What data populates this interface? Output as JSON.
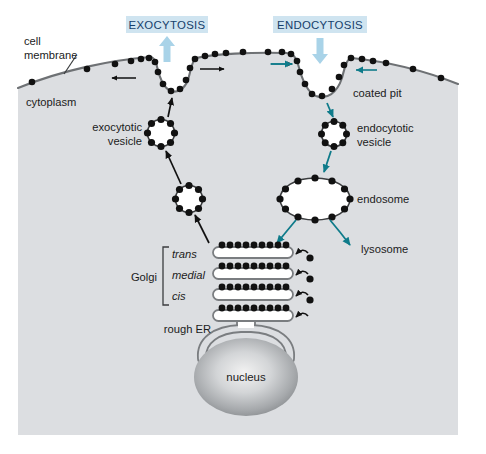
{
  "figure": {
    "width": 486,
    "height": 454
  },
  "colors": {
    "background": "#ffffff",
    "cytoplasm": "#dcdee1",
    "membrane_line": "#6e7174",
    "coat_dot": "#111111",
    "banner_fill": "#cfe4f0",
    "banner_text": "#15406b",
    "banner_arrow": "#a9d3e8",
    "teal_arrow": "#0f7b8a",
    "black_arrow": "#111111",
    "organelle_fill": "#ffffff",
    "organelle_stroke": "#7a7d80",
    "nucleus_light": "#e8e8e8",
    "nucleus_dark": "#8d9093"
  },
  "banners": [
    {
      "id": "exocytosis",
      "label": "EXOCYTOSIS",
      "x": 126,
      "y": 16,
      "w": 82,
      "h": 17,
      "arrow_direction": "up"
    },
    {
      "id": "endocytosis",
      "label": "ENDOCYTOSIS",
      "x": 273,
      "y": 16,
      "w": 94,
      "h": 17,
      "arrow_direction": "down"
    }
  ],
  "labels": [
    {
      "id": "cell-membrane",
      "text_line1": "cell",
      "text_line2": "membrane",
      "x": 24,
      "y": 43,
      "leader": true
    },
    {
      "id": "cytoplasm",
      "text_line1": "cytoplasm",
      "text_line2": "",
      "x": 26,
      "y": 104,
      "leader": false
    },
    {
      "id": "coated-pit",
      "text_line1": "coated pit",
      "text_line2": "",
      "x": 353,
      "y": 94,
      "leader": false
    },
    {
      "id": "exocytotic-vesicle",
      "text_line1": "exocytotic",
      "text_line2": "vesicle",
      "x": 85,
      "y": 132,
      "leader": false
    },
    {
      "id": "endocytotic-vesicle",
      "text_line1": "endocytotic",
      "text_line2": "vesicle",
      "x": 376,
      "y": 133,
      "leader": false
    },
    {
      "id": "endosome",
      "text_line1": "endosome",
      "text_line2": "",
      "x": 355,
      "y": 203,
      "leader": false
    },
    {
      "id": "lysosome",
      "text_line1": "lysosome",
      "text_line2": "",
      "x": 361,
      "y": 252,
      "leader": false
    },
    {
      "id": "golgi",
      "text_line1": "Golgi",
      "text_line2": "",
      "x": 130,
      "y": 277,
      "leader": false
    },
    {
      "id": "rough-er",
      "text_line1": "rough ER",
      "text_line2": "",
      "x": 159,
      "y": 330,
      "leader": false
    },
    {
      "id": "nucleus",
      "text_line1": "nucleus",
      "text_line2": "",
      "x": 246,
      "y": 377,
      "leader": false
    }
  ],
  "golgi_cisternae": [
    {
      "id": "trans",
      "label": "trans",
      "label_x": 171,
      "label_y": 258,
      "y": 252,
      "x": 213,
      "w": 78,
      "dots": 11
    },
    {
      "id": "medial",
      "label": "medial",
      "label_x": 171,
      "label_y": 277,
      "y": 271,
      "x": 213,
      "w": 78,
      "dots": 11
    },
    {
      "id": "cis",
      "label": "cis",
      "label_x": 171,
      "label_y": 296,
      "y": 290,
      "x": 213,
      "w": 78,
      "dots": 11
    },
    {
      "id": "rough-er-cisterna",
      "label": "",
      "label_x": 0,
      "label_y": 0,
      "y": 309,
      "x": 213,
      "w": 78,
      "dots": 11
    }
  ],
  "organelles": [
    {
      "id": "exocytotic-vesicle-upper",
      "shape": "coated-vesicle",
      "cx": 161,
      "cy": 133,
      "r": 14,
      "dots": 8
    },
    {
      "id": "exocytotic-vesicle-lower",
      "shape": "coated-vesicle",
      "cx": 189,
      "cy": 199,
      "r": 14,
      "dots": 8
    },
    {
      "id": "endocytotic-vesicle",
      "shape": "coated-vesicle",
      "cx": 334,
      "cy": 134,
      "r": 13,
      "dots": 8
    },
    {
      "id": "endosome",
      "shape": "coated-ellipse",
      "cx": 315,
      "cy": 199,
      "rx": 36,
      "ry": 22,
      "dots": 14
    },
    {
      "id": "nucleus",
      "shape": "ellipse",
      "cx": 246,
      "cy": 377,
      "rx": 52,
      "ry": 39
    }
  ],
  "flow_arrows": [
    {
      "id": "arrow-membrane-left-out",
      "color": "black",
      "direction": "left"
    },
    {
      "id": "arrow-membrane-right-out",
      "color": "black",
      "direction": "right"
    },
    {
      "id": "arrow-exocytosis-fuse",
      "color": "black",
      "direction": "up"
    },
    {
      "id": "arrow-vesicle-to-vesicle",
      "color": "black",
      "direction": "up-left"
    },
    {
      "id": "arrow-golgi-to-vesicle",
      "color": "black",
      "direction": "up-left"
    },
    {
      "id": "arrow-membrane-in-left",
      "color": "teal",
      "direction": "right"
    },
    {
      "id": "arrow-membrane-in-right",
      "color": "teal",
      "direction": "left"
    },
    {
      "id": "arrow-pit-to-vesicle",
      "color": "teal",
      "direction": "down-left"
    },
    {
      "id": "arrow-vesicle-to-endosome",
      "color": "teal",
      "direction": "down-left"
    },
    {
      "id": "arrow-endosome-to-golgi",
      "color": "teal",
      "direction": "down-left"
    },
    {
      "id": "arrow-endosome-to-lysosome",
      "color": "teal",
      "direction": "down-right"
    }
  ]
}
